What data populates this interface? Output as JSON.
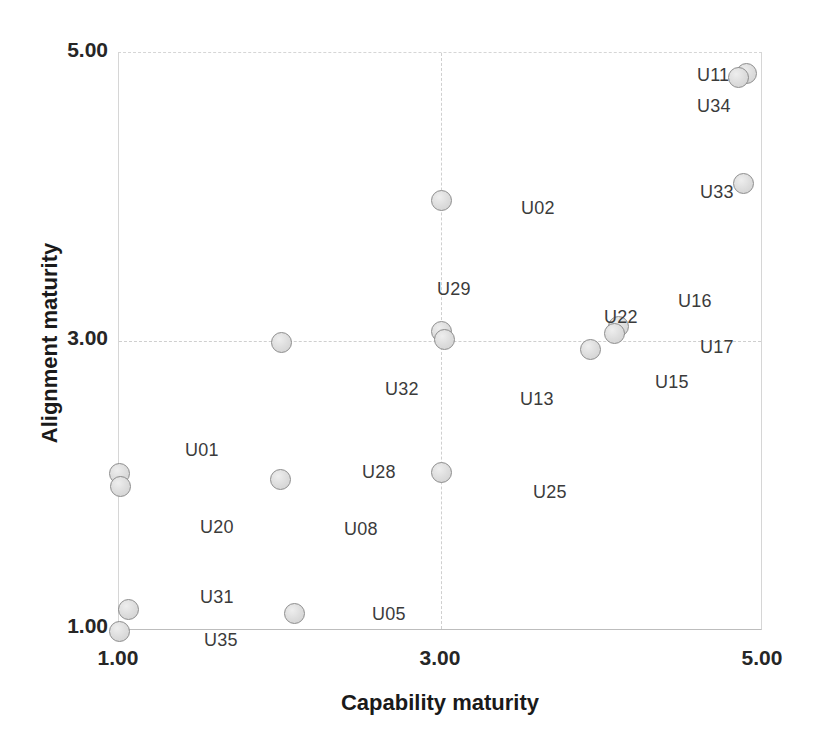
{
  "chart_data": {
    "type": "scatter",
    "title": "",
    "xlabel": "Capability maturity",
    "ylabel": "Alignment maturity",
    "xlim": [
      1.0,
      5.0
    ],
    "ylim": [
      1.0,
      5.0
    ],
    "xticks": [
      "1.00",
      "3.00",
      "5.00"
    ],
    "xtick_values": [
      1.0,
      3.0,
      5.0
    ],
    "yticks": [
      "5.00",
      "3.00",
      "1.00"
    ],
    "ytick_values": [
      5.0,
      3.0,
      1.0
    ],
    "grid": true,
    "legend": "none",
    "marker_fill": "#dedede",
    "marker_edge": "#8c8c8c",
    "points": [
      {
        "id": "U11",
        "x": 4.9,
        "y": 4.86
      },
      {
        "id": "U34",
        "x": 4.85,
        "y": 4.83
      },
      {
        "id": "U33",
        "x": 4.88,
        "y": 4.1
      },
      {
        "id": "U02",
        "x": 3.0,
        "y": 3.98
      },
      {
        "id": "U29",
        "x": 3.0,
        "y": 3.07
      },
      {
        "id": "U13",
        "x": 3.02,
        "y": 3.02
      },
      {
        "id": "U32",
        "x": 2.01,
        "y": 3.0
      },
      {
        "id": "U16",
        "x": 4.1,
        "y": 3.11
      },
      {
        "id": "U22",
        "x": 4.08,
        "y": 3.06
      },
      {
        "id": "U17",
        "x": 3.93,
        "y": 2.95
      },
      {
        "id": "U01",
        "x": 1.0,
        "y": 2.09
      },
      {
        "id": "U20",
        "x": 1.01,
        "y": 2.0
      },
      {
        "id": "U08",
        "x": 2.0,
        "y": 2.05
      },
      {
        "id": "U25",
        "x": 3.0,
        "y": 2.1
      },
      {
        "id": "U31",
        "x": 1.06,
        "y": 1.15
      },
      {
        "id": "U35",
        "x": 1.0,
        "y": 1.0
      },
      {
        "id": "U05",
        "x": 2.09,
        "y": 1.12
      }
    ],
    "point_labels": [
      {
        "text": "U11",
        "x": 697,
        "y": 65
      },
      {
        "text": "U34",
        "x": 697,
        "y": 96
      },
      {
        "text": "U33",
        "x": 700,
        "y": 182
      },
      {
        "text": "U02",
        "x": 521,
        "y": 198
      },
      {
        "text": "U29",
        "x": 437,
        "y": 279
      },
      {
        "text": "U16",
        "x": 678,
        "y": 291
      },
      {
        "text": "U22",
        "x": 604,
        "y": 307
      },
      {
        "text": "U17",
        "x": 700,
        "y": 337
      },
      {
        "text": "U15",
        "x": 655,
        "y": 372
      },
      {
        "text": "U32",
        "x": 385,
        "y": 379
      },
      {
        "text": "U13",
        "x": 520,
        "y": 389
      },
      {
        "text": "U01",
        "x": 185,
        "y": 440
      },
      {
        "text": "U28",
        "x": 362,
        "y": 462
      },
      {
        "text": "U25",
        "x": 533,
        "y": 482
      },
      {
        "text": "U20",
        "x": 200,
        "y": 517
      },
      {
        "text": "U08",
        "x": 344,
        "y": 519
      },
      {
        "text": "U31",
        "x": 200,
        "y": 587
      },
      {
        "text": "U05",
        "x": 372,
        "y": 604
      },
      {
        "text": "U35",
        "x": 204,
        "y": 630
      }
    ]
  },
  "axes": {
    "x_title": "Capability maturity",
    "y_title": "Alignment maturity",
    "x_tick_labels": [
      "1.00",
      "3.00",
      "5.00"
    ],
    "y_tick_labels": [
      "5.00",
      "3.00",
      "1.00"
    ]
  }
}
